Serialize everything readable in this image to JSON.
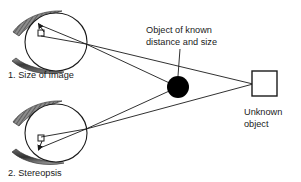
{
  "diagram": {
    "background_color": "#ffffff",
    "stroke_color": "#1a1a1a",
    "fill_black": "#000000",
    "eyelid_color": "#555555",
    "canvas": {
      "width": 301,
      "height": 182
    },
    "eyes": [
      {
        "id": "eye-top",
        "label": "1. Size of image",
        "label_x": 8,
        "label_y": 78,
        "center_x": 56,
        "center_y": 42,
        "radius_x": 31,
        "radius_y": 29,
        "nodal_x": 86,
        "nodal_y": 44,
        "retina_square_x": 38,
        "retina_square_y": 30,
        "retina_square_size": 6
      },
      {
        "id": "eye-bottom",
        "label": "2. Stereopsis",
        "label_x": 8,
        "label_y": 176,
        "center_x": 56,
        "center_y": 133,
        "radius_x": 31,
        "radius_y": 29,
        "nodal_x": 86,
        "nodal_y": 129,
        "retina_square_x": 38,
        "retina_square_y": 135,
        "retina_square_size": 6
      }
    ],
    "known_object": {
      "label_line_1": "Object of known",
      "label_line_2": "distance and size",
      "label_x": 146,
      "label_y": 33,
      "circle_cx": 178,
      "circle_cy": 87,
      "circle_r": 11,
      "leader_x1": 180,
      "leader_y1": 49,
      "leader_x2": 178,
      "leader_y2": 76
    },
    "unknown_object": {
      "label_line_1": "Unknown",
      "label_line_2": "object",
      "label_x": 244,
      "label_y": 115,
      "box_x": 252,
      "box_y": 71,
      "box_w": 25,
      "box_h": 25,
      "target_x": 253,
      "target_y": 84
    },
    "rays": [
      {
        "name": "top-eye-to-known-object",
        "x1": 86,
        "y1": 44,
        "x2": 178,
        "y2": 87
      },
      {
        "name": "top-eye-to-unknown-object",
        "x1": 86,
        "y1": 44,
        "x2": 253,
        "y2": 84
      },
      {
        "name": "bottom-eye-to-known-object",
        "x1": 86,
        "y1": 129,
        "x2": 178,
        "y2": 87
      },
      {
        "name": "bottom-eye-to-unknown-object",
        "x1": 86,
        "y1": 129,
        "x2": 253,
        "y2": 84
      }
    ]
  }
}
